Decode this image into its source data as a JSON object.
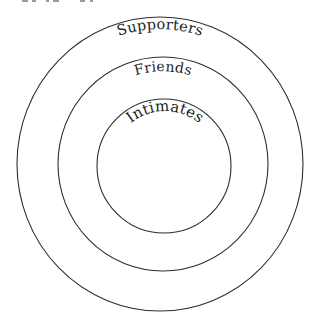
{
  "diagram": {
    "type": "concentric-circles",
    "stroke_color": "#2e2e2e",
    "background": "#ffffff",
    "rings": [
      {
        "id": "outer",
        "label": "Supporters",
        "center": [
          160,
          164
        ],
        "rx": 143,
        "ry": 147
      },
      {
        "id": "middle",
        "label": "Friends",
        "center": [
          163,
          164
        ],
        "rx": 105,
        "ry": 107
      },
      {
        "id": "inner",
        "label": "Intimates",
        "center": [
          164,
          166
        ],
        "rx": 67,
        "ry": 67
      }
    ]
  }
}
